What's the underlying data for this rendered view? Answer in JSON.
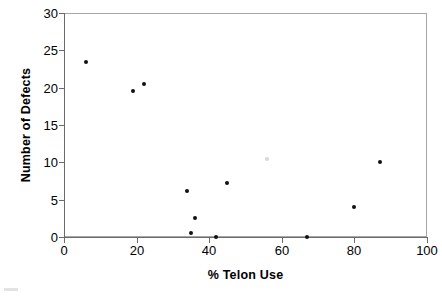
{
  "chart_data": {
    "type": "scatter",
    "title": "",
    "xlabel": "% Telon Use",
    "ylabel": "Number of Defects",
    "xlim": [
      0,
      100
    ],
    "ylim": [
      0,
      30
    ],
    "xticks": [
      0,
      20,
      40,
      60,
      80,
      100
    ],
    "yticks": [
      0,
      5,
      10,
      15,
      20,
      25,
      30
    ],
    "xtick_labels": [
      "0",
      "20",
      "40",
      "60",
      "80",
      "100"
    ],
    "ytick_labels": [
      "0",
      "5",
      "10",
      "15",
      "20",
      "25",
      "30"
    ],
    "grid": false,
    "legend": false,
    "marker": "dot",
    "marker_color": "#111111",
    "series": [
      {
        "name": "Defects vs Telon Use",
        "points": [
          {
            "x": 6,
            "y": 23.5
          },
          {
            "x": 19,
            "y": 19.5
          },
          {
            "x": 22,
            "y": 20.5
          },
          {
            "x": 34,
            "y": 6.2
          },
          {
            "x": 35,
            "y": 0.5
          },
          {
            "x": 36,
            "y": 2.5
          },
          {
            "x": 42,
            "y": 0.0
          },
          {
            "x": 45,
            "y": 7.2
          },
          {
            "x": 56,
            "y": 10.5
          },
          {
            "x": 67,
            "y": 0.0
          },
          {
            "x": 80,
            "y": 4.0
          },
          {
            "x": 87,
            "y": 10.0
          }
        ]
      }
    ]
  },
  "axes": {
    "x_title": "% Telon Use",
    "y_title": "Number of Defects"
  },
  "colors": {
    "marker": "#111111",
    "axis": "#6b6b6b",
    "frame": "#a6a6a6",
    "background": "#ffffff"
  }
}
